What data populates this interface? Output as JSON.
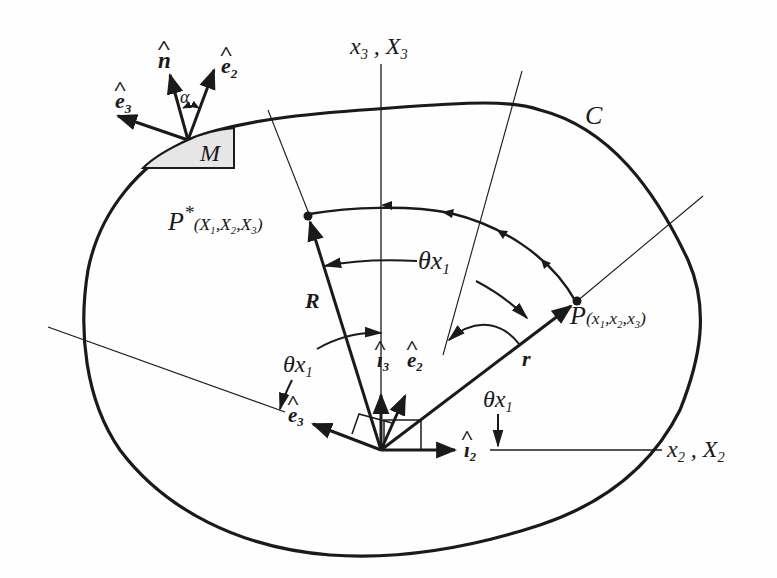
{
  "figure": {
    "type": "vector-rotation-diagram",
    "curve_label": "C",
    "region_label": "M",
    "axes": {
      "vertical": {
        "lower": "x",
        "lower_sub": "3",
        "sep": " , ",
        "upper": "X",
        "upper_sub": "3"
      },
      "horizontal": {
        "lower": "x",
        "lower_sub": "2",
        "sep": " , ",
        "upper": "X",
        "upper_sub": "2"
      }
    },
    "points": {
      "P_star": {
        "name": "P",
        "sup": "*",
        "coords": "(X",
        "c1": "1",
        "c2": "2",
        "c3": "3",
        "full": "P*(X1,X2,X3)"
      },
      "P": {
        "name": "P",
        "full": "P(x1,x2,x3)",
        "c1": "1",
        "c2": "2",
        "c3": "3"
      }
    },
    "vectors": {
      "R": "R",
      "r": "r"
    },
    "unit_vectors": {
      "n_hat": "n",
      "e2_hat_top": {
        "base": "e",
        "sub": "2"
      },
      "e3_hat_top": {
        "base": "e",
        "sub": "3"
      },
      "i3_hat": {
        "base": "ı",
        "sub": "3"
      },
      "e2_hat_origin": {
        "base": "e",
        "sub": "2"
      },
      "e3_hat_origin": {
        "base": "e",
        "sub": "3"
      },
      "i2_hat": {
        "base": "ı",
        "sub": "2"
      }
    },
    "angles": {
      "alpha": "α",
      "theta_x1_top": {
        "base": "θx",
        "sub": "1"
      },
      "theta_x1_left": {
        "base": "θx",
        "sub": "1"
      },
      "theta_x1_right": {
        "base": "θx",
        "sub": "1"
      }
    },
    "colors": {
      "ink": "#1a1a1a",
      "shade": "#e6e6e6",
      "background": "#fefefe"
    }
  }
}
